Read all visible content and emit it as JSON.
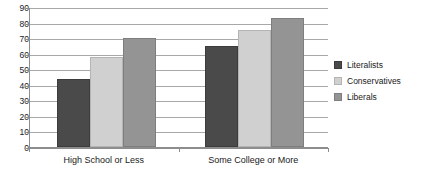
{
  "chart_data": {
    "type": "bar",
    "title": "",
    "subtitle": "",
    "xlabel": "",
    "ylabel": "",
    "categories": [
      "High School or Less",
      "Some College or More"
    ],
    "series": [
      {
        "name": "Literalists",
        "color": "#4a4a4a",
        "values": [
          44,
          65
        ]
      },
      {
        "name": "Conservatives",
        "color": "#d0d0d0",
        "values": [
          58,
          75
        ]
      },
      {
        "name": "Liberals",
        "color": "#949494",
        "values": [
          70,
          83
        ]
      }
    ],
    "ylim": [
      0,
      90
    ],
    "ytick_step": 10,
    "yticks": [
      90,
      80,
      70,
      60,
      50,
      40,
      30,
      20,
      10,
      0
    ],
    "ytick_labels": [
      "90",
      "80",
      "70",
      "60",
      "50",
      "40",
      "30",
      "20",
      "10",
      "0"
    ],
    "grid": true,
    "grid_axis": "y",
    "legend_position": "right",
    "annotations": []
  }
}
